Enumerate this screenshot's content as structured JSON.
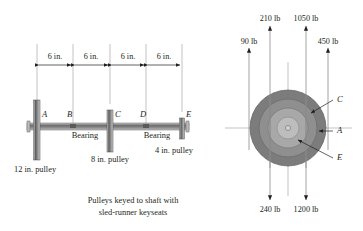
{
  "figure": {
    "caption_line1": "Pulleys keyed to shaft with",
    "caption_line2": "sled-runner keyseats"
  },
  "left_view": {
    "name": "shaft-elevation-view",
    "dimensions": [
      {
        "label": "6 in.",
        "from": "A",
        "to": "B"
      },
      {
        "label": "6 in.",
        "from": "B",
        "to": "C"
      },
      {
        "label": "6 in.",
        "from": "C",
        "to": "D"
      },
      {
        "label": "6 in.",
        "from": "D",
        "to": "E"
      }
    ],
    "stations": [
      {
        "id": "A",
        "label": "A",
        "x": 37,
        "type": "pulley",
        "size": "12 in."
      },
      {
        "id": "B",
        "label": "B",
        "x": 73,
        "type": "bearing",
        "size": ""
      },
      {
        "id": "C",
        "label": "C",
        "x": 110,
        "type": "pulley",
        "size": "8 in."
      },
      {
        "id": "D",
        "label": "D",
        "x": 146,
        "type": "bearing",
        "size": ""
      },
      {
        "id": "E",
        "label": "E",
        "x": 182,
        "type": "pulley",
        "size": "4 in."
      }
    ],
    "bearing_labels": [
      "Bearing",
      "Bearing"
    ],
    "pulley_labels": {
      "a": "12 in. pulley",
      "c": "8 in. pulley",
      "e": "4 in. pulley"
    }
  },
  "right_view": {
    "name": "end-view-force-diagram",
    "circles": [
      {
        "id": "C",
        "label": "C",
        "diameter_in": 12,
        "radius_px": 38,
        "fill": "#7c7c7c"
      },
      {
        "id": "A",
        "label": "A",
        "diameter_in": 8,
        "radius_px": 29,
        "fill": "#8f8f8f"
      },
      {
        "id": "E",
        "label": "E",
        "diameter_in": 4,
        "radius_px": 20,
        "fill": "#a8a8a8"
      },
      {
        "id": "hub",
        "label": "",
        "diameter_in": 0,
        "radius_px": 11,
        "fill": "#bdbdbd"
      }
    ],
    "forces_up": [
      {
        "label": "90 lb",
        "value": 90,
        "unit": "lb",
        "direction": "up",
        "x": 249
      },
      {
        "label": "210 lb",
        "value": 210,
        "unit": "lb",
        "direction": "up",
        "x": 270
      },
      {
        "label": "1050 lb",
        "value": 1050,
        "unit": "lb",
        "direction": "up",
        "x": 306
      },
      {
        "label": "450 lb",
        "value": 450,
        "unit": "lb",
        "direction": "up",
        "x": 328
      }
    ],
    "forces_down": [
      {
        "label": "240 lb",
        "value": 240,
        "unit": "lb",
        "direction": "down",
        "x": 270
      },
      {
        "label": "1200 lb",
        "value": 1200,
        "unit": "lb",
        "direction": "down",
        "x": 306
      }
    ],
    "leader_labels": [
      "C",
      "A",
      "E"
    ],
    "center": {
      "x": 288,
      "y": 128
    }
  },
  "colors": {
    "line": "#231f20",
    "text": "#231f20",
    "shaft": "#8a8a8a",
    "pulley_dark": "#6f6f6f",
    "circle_outer": "#7c7c7c",
    "circle_mid": "#8f8f8f",
    "circle_inner": "#a8a8a8",
    "hub": "#bdbdbd",
    "thin": "#9a9a9a"
  }
}
